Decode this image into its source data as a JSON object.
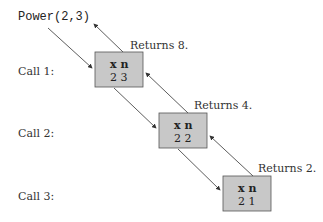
{
  "diagram": {
    "initial_call": "Power(2,3)",
    "calls": [
      {
        "label": "Call 1:",
        "header": "x n",
        "values": "2 3",
        "returns": "Returns 8."
      },
      {
        "label": "Call 2:",
        "header": "x n",
        "values": "2 2",
        "returns": "Returns 4."
      },
      {
        "label": "Call 3:",
        "header": "x n",
        "values": "2 1",
        "returns": "Returns 2."
      }
    ],
    "colors": {
      "box_fill": "#c8c8c8",
      "box_stroke": "#555555",
      "arrow": "#333333"
    }
  }
}
